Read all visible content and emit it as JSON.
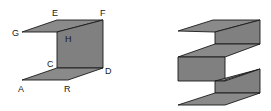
{
  "figure": {
    "left_shape": {
      "description": "folded sheet with labeled vertices",
      "fill_color": "#808080",
      "labels": {
        "A": "A",
        "R": "R",
        "C": "C",
        "D": "D",
        "G": "G",
        "H": "H",
        "E": "E",
        "F": "F"
      }
    },
    "right_shape": {
      "description": "multiple-fold zigzag sheet",
      "fill_color": "#808080"
    }
  }
}
